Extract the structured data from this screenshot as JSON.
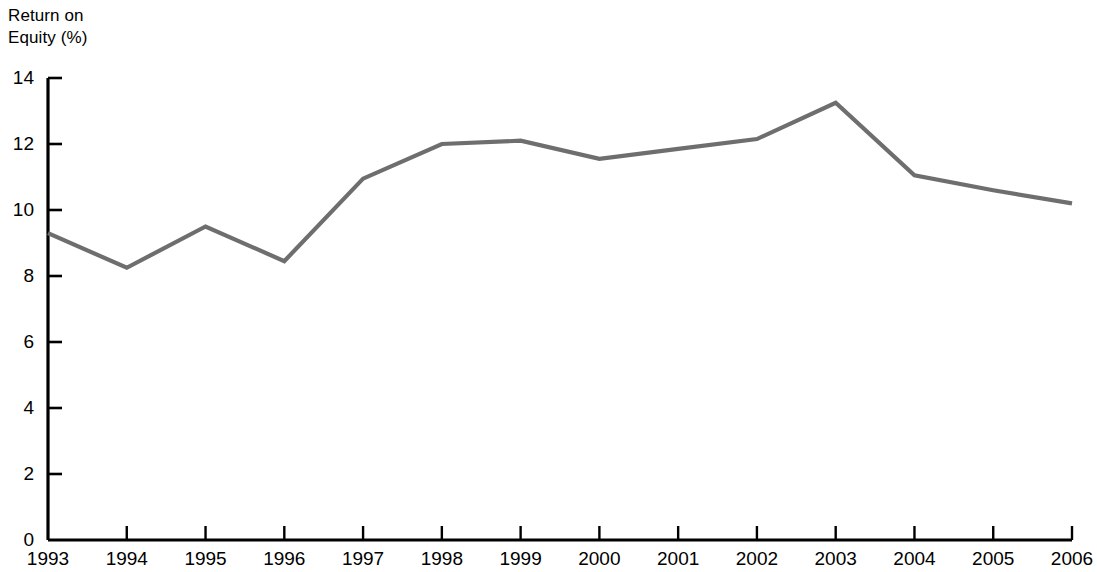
{
  "chart_data": {
    "type": "line",
    "title": "Return on\nEquity (%)",
    "title_lines": [
      "Return on",
      "Equity (%)"
    ],
    "xlabel": "",
    "ylabel": "Return on Equity (%)",
    "categories": [
      "1993",
      "1994",
      "1995",
      "1996",
      "1997",
      "1998",
      "1999",
      "2000",
      "2001",
      "2002",
      "2003",
      "2004",
      "2005",
      "2006"
    ],
    "values": [
      9.3,
      8.25,
      9.5,
      8.45,
      10.95,
      12.0,
      12.1,
      11.55,
      11.85,
      12.15,
      13.25,
      11.05,
      10.6,
      10.2
    ],
    "series": [
      {
        "name": "Return on Equity (%)",
        "values": [
          9.3,
          8.25,
          9.5,
          8.45,
          10.95,
          12.0,
          12.1,
          11.55,
          11.85,
          12.15,
          13.25,
          11.05,
          10.6,
          10.2
        ]
      }
    ],
    "ylim": [
      0,
      14
    ],
    "yticks": [
      0,
      2,
      4,
      6,
      8,
      10,
      12,
      14
    ],
    "ytick_labels": [
      "0",
      "2",
      "4",
      "6",
      "8",
      "10",
      "12",
      "14"
    ],
    "xticks": [
      "1993",
      "1994",
      "1995",
      "1996",
      "1997",
      "1998",
      "1999",
      "2000",
      "2001",
      "2002",
      "2003",
      "2004",
      "2005",
      "2006"
    ],
    "grid": false,
    "legend": false,
    "legend_position": "none",
    "line_color": "#6e6e6e",
    "axis_color": "#000000",
    "background_color": "#ffffff"
  }
}
